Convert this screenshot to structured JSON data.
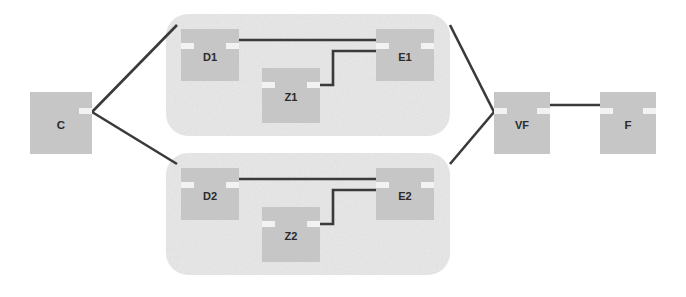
{
  "diagram": {
    "type": "network-topology",
    "background_color": "#ffffff",
    "node_fill_color": "#c6c6c6",
    "node_notch_color": "#f2f2f2",
    "container_fill_color": "#e8e8e8",
    "edge_color": "#3a3a3a",
    "label_color": "#2a2a2a",
    "nodes": [
      {
        "id": "C",
        "label": "C",
        "x": 30,
        "y": 92,
        "w": 62,
        "h": 62,
        "notch_left": false,
        "notch_right": true
      },
      {
        "id": "D1",
        "label": "D1",
        "x": 181,
        "y": 29,
        "w": 58,
        "h": 52,
        "notch_left": true,
        "notch_right": true
      },
      {
        "id": "Z1",
        "label": "Z1",
        "x": 262,
        "y": 68,
        "w": 58,
        "h": 55,
        "notch_left": true,
        "notch_right": true
      },
      {
        "id": "E1",
        "label": "E1",
        "x": 376,
        "y": 29,
        "w": 58,
        "h": 52,
        "notch_left": true,
        "notch_right": true
      },
      {
        "id": "D2",
        "label": "D2",
        "x": 181,
        "y": 168,
        "w": 58,
        "h": 52,
        "notch_left": true,
        "notch_right": true
      },
      {
        "id": "Z2",
        "label": "Z2",
        "x": 262,
        "y": 207,
        "w": 58,
        "h": 55,
        "notch_left": true,
        "notch_right": true
      },
      {
        "id": "E2",
        "label": "E2",
        "x": 376,
        "y": 168,
        "w": 58,
        "h": 52,
        "notch_left": true,
        "notch_right": true
      },
      {
        "id": "VF",
        "label": "VF",
        "x": 494,
        "y": 92,
        "w": 56,
        "h": 62,
        "notch_left": true,
        "notch_right": true
      },
      {
        "id": "F",
        "label": "F",
        "x": 600,
        "y": 92,
        "w": 56,
        "h": 62,
        "notch_left": true,
        "notch_right": true
      }
    ],
    "containers": [
      {
        "id": "subnet-1",
        "x": 166,
        "y": 14,
        "w": 284,
        "h": 122,
        "rx": 22
      },
      {
        "id": "subnet-2",
        "x": 166,
        "y": 153,
        "w": 284,
        "h": 122,
        "rx": 22
      }
    ],
    "edges": [
      {
        "id": "c-to-d1",
        "from": "C",
        "to": "D1",
        "kind": "diagonal"
      },
      {
        "id": "c-to-d2",
        "from": "C",
        "to": "D2",
        "kind": "diagonal"
      },
      {
        "id": "d1-to-e1",
        "from": "D1",
        "to": "E1",
        "kind": "straight"
      },
      {
        "id": "e1-to-z1",
        "from": "E1",
        "to": "Z1",
        "kind": "orthogonal"
      },
      {
        "id": "d2-to-e2",
        "from": "D2",
        "to": "E2",
        "kind": "straight"
      },
      {
        "id": "e2-to-z2",
        "from": "E2",
        "to": "Z2",
        "kind": "orthogonal"
      },
      {
        "id": "e1-to-vf",
        "from": "E1",
        "to": "VF",
        "kind": "diagonal"
      },
      {
        "id": "e2-to-vf",
        "from": "E2",
        "to": "VF",
        "kind": "diagonal"
      },
      {
        "id": "vf-to-f",
        "from": "VF",
        "to": "F",
        "kind": "straight"
      }
    ]
  }
}
